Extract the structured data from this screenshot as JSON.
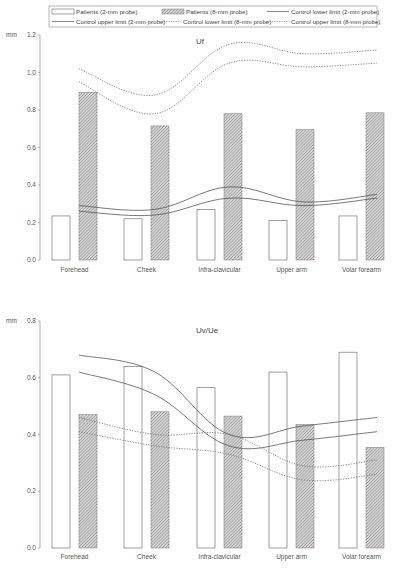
{
  "legend": {
    "items": [
      {
        "label": "Patients (2-mm probe)",
        "style": "open-bar"
      },
      {
        "label": "Patients (8-mm probe)",
        "style": "hatched-bar"
      },
      {
        "label": "Control lower limit (2-mm probe)",
        "style": "solid-line"
      },
      {
        "label": "Control upper limit (2-mm probe)",
        "style": "solid-line"
      },
      {
        "label": "Control lower limit (8-mm probe)",
        "style": "dotted-line"
      },
      {
        "label": "Control upper limit (8-mm probe)",
        "style": "dotted-line"
      }
    ]
  },
  "colors": {
    "bar_outline": "#777777",
    "hatch": "#8a8a8a",
    "solid_line": "#555555",
    "dotted_line": "#777777",
    "axis": "#888888"
  },
  "chart_data": [
    {
      "type": "bar",
      "title": "Uf",
      "ylabel": "mm",
      "xlabel": "",
      "ylim": [
        0,
        1.2
      ],
      "yticks": [
        "0.0",
        "0.2",
        "0.4",
        "0.6",
        "0.8",
        "1.0",
        "1.2"
      ],
      "categories": [
        "Forehead",
        "Cheek",
        "Infra-clavicular",
        "Upper arm",
        "Volar forearm"
      ],
      "series": [
        {
          "name": "Patients (2-mm probe)",
          "kind": "bar",
          "values": [
            0.235,
            0.22,
            0.27,
            0.21,
            0.235
          ]
        },
        {
          "name": "Patients (8-mm probe)",
          "kind": "bar",
          "values": [
            0.895,
            0.715,
            0.78,
            0.695,
            0.785
          ]
        },
        {
          "name": "Control lower limit (2-mm probe)",
          "kind": "line",
          "values": [
            0.26,
            0.24,
            0.33,
            0.29,
            0.33
          ]
        },
        {
          "name": "Control upper limit (2-mm probe)",
          "kind": "line",
          "values": [
            0.29,
            0.27,
            0.39,
            0.31,
            0.35
          ]
        },
        {
          "name": "Control lower limit (8-mm probe)",
          "kind": "line",
          "values": [
            0.95,
            0.78,
            1.05,
            1.03,
            1.05
          ]
        },
        {
          "name": "Control upper limit (8-mm probe)",
          "kind": "line",
          "values": [
            1.02,
            0.88,
            1.15,
            1.1,
            1.12
          ]
        }
      ],
      "grid": false,
      "legend_position": "top"
    },
    {
      "type": "bar",
      "title": "Uv/Ue",
      "ylabel": "mm",
      "xlabel": "",
      "ylim": [
        0,
        0.8
      ],
      "yticks": [
        "0.0",
        "0.2",
        "0.4",
        "0.6",
        "0.8"
      ],
      "categories": [
        "Forehead",
        "Cheek",
        "Infra-clavicular",
        "Upper arm",
        "Volar forearm"
      ],
      "series": [
        {
          "name": "Patients (2-mm probe)",
          "kind": "bar",
          "values": [
            0.61,
            0.64,
            0.565,
            0.62,
            0.69
          ]
        },
        {
          "name": "Patients (8-mm probe)",
          "kind": "bar",
          "values": [
            0.47,
            0.48,
            0.465,
            0.435,
            0.355
          ]
        },
        {
          "name": "Control lower limit (2-mm probe)",
          "kind": "line",
          "values": [
            0.62,
            0.54,
            0.36,
            0.38,
            0.41
          ]
        },
        {
          "name": "Control upper limit (2-mm probe)",
          "kind": "line",
          "values": [
            0.68,
            0.62,
            0.4,
            0.43,
            0.46
          ]
        },
        {
          "name": "Control lower limit (8-mm probe)",
          "kind": "line",
          "values": [
            0.41,
            0.36,
            0.33,
            0.24,
            0.26
          ]
        },
        {
          "name": "Control upper limit (8-mm probe)",
          "kind": "line",
          "values": [
            0.46,
            0.4,
            0.4,
            0.29,
            0.31
          ]
        }
      ],
      "grid": false,
      "legend_position": "top"
    }
  ]
}
